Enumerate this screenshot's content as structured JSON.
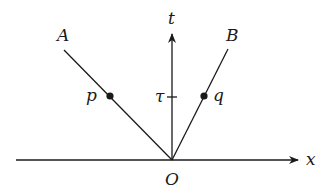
{
  "diagram": {
    "axes": {
      "x_label": "x",
      "t_label": "t",
      "origin_label": "O",
      "tick_label": "τ"
    },
    "lines": [
      {
        "label": "A",
        "point_label": "p"
      },
      {
        "label": "B",
        "point_label": "q"
      }
    ],
    "colors": {
      "stroke": "#1a1a1a",
      "background": "#ffffff"
    }
  }
}
